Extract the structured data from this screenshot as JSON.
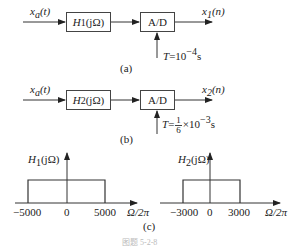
{
  "diagram_a": {
    "input_label_base": "x",
    "input_label_sub": "a",
    "input_label_arg": "(t)",
    "filter_label_base": "H",
    "filter_label_sub": "1",
    "filter_label_arg": "(jΩ)",
    "converter_label": "A/D",
    "output_label_base": "x",
    "output_label_sub": "1",
    "output_label_arg": "(n)",
    "sampling_label_prefix": "T",
    "sampling_label_value": "=10",
    "sampling_label_exp": "−4",
    "sampling_label_unit": "s",
    "caption": "(a)"
  },
  "diagram_b": {
    "input_label_base": "x",
    "input_label_sub": "a",
    "input_label_arg": "(t)",
    "filter_label_base": "H",
    "filter_label_sub": "2",
    "filter_label_arg": "(jΩ)",
    "converter_label": "A/D",
    "output_label_base": "x",
    "output_label_sub": "2",
    "output_label_arg": "(n)",
    "sampling_label_prefix": "T",
    "sampling_label_eq": "=",
    "sampling_frac_num": "1",
    "sampling_frac_den": "6",
    "sampling_label_times": "×10",
    "sampling_label_exp": "−3",
    "sampling_label_unit": "s",
    "caption": "(b)"
  },
  "plots": {
    "h1": {
      "ylabel_base": "H",
      "ylabel_sub": "1",
      "ylabel_arg": "(jΩ)",
      "ticks": [
        "−5000",
        "0",
        "5000"
      ],
      "xlabel": "Ω/2π"
    },
    "h2": {
      "ylabel_base": "H",
      "ylabel_sub": "2",
      "ylabel_arg": "(jΩ)",
      "ticks": [
        "−3000",
        "0",
        "3000"
      ],
      "xlabel": "Ω/2π"
    },
    "caption": "(c)"
  },
  "figure_caption": "图题 5-2-8"
}
